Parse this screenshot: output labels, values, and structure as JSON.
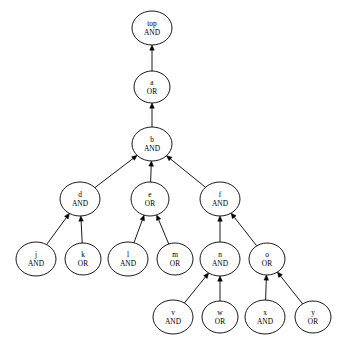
{
  "diagram": {
    "type": "directed-acyclic-graph",
    "layout": "bottom-up-arrows",
    "background_color": "#ffffff",
    "node_fill": "#ffffff",
    "node_stroke": "#000000",
    "edge_color": "#000000"
  },
  "nodes": [
    {
      "id": "top",
      "name": "top",
      "gate": "AND",
      "cx": 152,
      "cy": 28,
      "rx": 20,
      "ry": 17
    },
    {
      "id": "a",
      "name": "a",
      "gate": "OR",
      "cx": 152,
      "cy": 87,
      "rx": 18,
      "ry": 16
    },
    {
      "id": "b",
      "name": "b",
      "gate": "AND",
      "cx": 152,
      "cy": 144,
      "rx": 20,
      "ry": 17
    },
    {
      "id": "d",
      "name": "d",
      "gate": "AND",
      "cx": 80,
      "cy": 199,
      "rx": 20,
      "ry": 17
    },
    {
      "id": "e",
      "name": "e",
      "gate": "OR",
      "cx": 150,
      "cy": 199,
      "rx": 19,
      "ry": 17
    },
    {
      "id": "f",
      "name": "f",
      "gate": "AND",
      "cx": 220,
      "cy": 199,
      "rx": 20,
      "ry": 17
    },
    {
      "id": "j",
      "name": "j",
      "gate": "AND",
      "cx": 36,
      "cy": 259,
      "rx": 20,
      "ry": 17
    },
    {
      "id": "k",
      "name": "k",
      "gate": "OR",
      "cx": 83,
      "cy": 259,
      "rx": 18,
      "ry": 16
    },
    {
      "id": "l",
      "name": "l",
      "gate": "AND",
      "cx": 128,
      "cy": 259,
      "rx": 20,
      "ry": 17
    },
    {
      "id": "m",
      "name": "m",
      "gate": "OR",
      "cx": 175,
      "cy": 259,
      "rx": 18,
      "ry": 16
    },
    {
      "id": "n",
      "name": "n",
      "gate": "AND",
      "cx": 220,
      "cy": 259,
      "rx": 20,
      "ry": 17
    },
    {
      "id": "o",
      "name": "o",
      "gate": "OR",
      "cx": 267,
      "cy": 259,
      "rx": 18,
      "ry": 16
    },
    {
      "id": "v",
      "name": "v",
      "gate": "AND",
      "cx": 173,
      "cy": 317,
      "rx": 20,
      "ry": 17
    },
    {
      "id": "w",
      "name": "w",
      "gate": "OR",
      "cx": 220,
      "cy": 317,
      "rx": 18,
      "ry": 16
    },
    {
      "id": "x",
      "name": "x",
      "gate": "AND",
      "cx": 265,
      "cy": 317,
      "rx": 20,
      "ry": 17
    },
    {
      "id": "y",
      "name": "y",
      "gate": "OR",
      "cx": 313,
      "cy": 317,
      "rx": 18,
      "ry": 16
    }
  ],
  "edges": [
    {
      "from": "a",
      "to": "top"
    },
    {
      "from": "b",
      "to": "a"
    },
    {
      "from": "d",
      "to": "b"
    },
    {
      "from": "e",
      "to": "b"
    },
    {
      "from": "f",
      "to": "b"
    },
    {
      "from": "j",
      "to": "d"
    },
    {
      "from": "k",
      "to": "d"
    },
    {
      "from": "l",
      "to": "e"
    },
    {
      "from": "m",
      "to": "e"
    },
    {
      "from": "n",
      "to": "f"
    },
    {
      "from": "o",
      "to": "f"
    },
    {
      "from": "v",
      "to": "n"
    },
    {
      "from": "w",
      "to": "n"
    },
    {
      "from": "x",
      "to": "o"
    },
    {
      "from": "y",
      "to": "o"
    }
  ]
}
